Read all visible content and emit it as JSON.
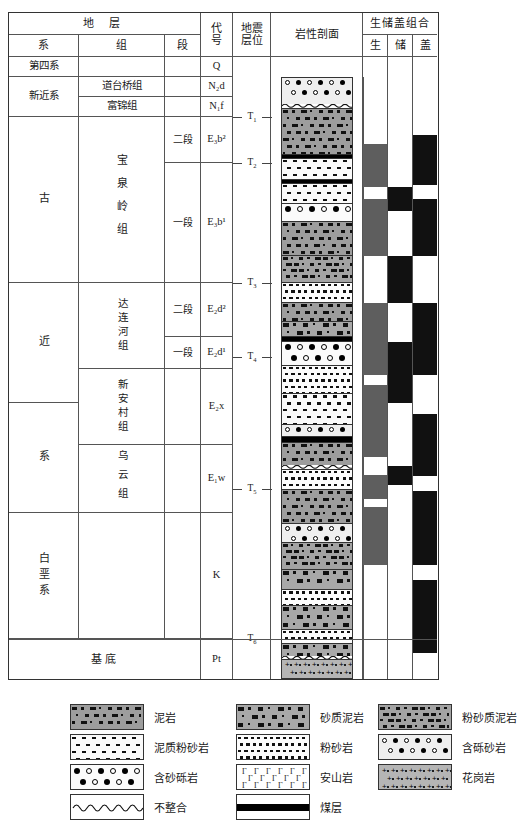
{
  "figure": {
    "type": "stratigraphic-column"
  },
  "header": {
    "strata_group": "地 层",
    "col_system": "系",
    "col_formation": "组",
    "col_member": "段",
    "col_code": "代号",
    "col_code_l1": "代",
    "col_code_l2": "号",
    "col_seismic_l1": "地震",
    "col_seismic_l2": "层位",
    "col_lithology": "岩性剖面",
    "col_assemblage": "生储盖组合",
    "col_source": "生",
    "col_reservoir": "储",
    "col_cap": "盖"
  },
  "rows": [
    {
      "system": "第四系",
      "formation": "",
      "member": "",
      "code_main": "Q",
      "code_sub": "",
      "code_sup": "",
      "code_italic": ""
    },
    {
      "system": "新近系",
      "formation": "道台桥组",
      "member": "",
      "code_main": "N",
      "code_sub": "2",
      "code_italic": "d",
      "code_sup": ""
    },
    {
      "system": "新近系",
      "formation": "富锦组",
      "member": "",
      "code_main": "N",
      "code_sub": "1",
      "code_italic": "f",
      "code_sup": ""
    },
    {
      "system": "古",
      "formation": "宝泉岭组",
      "member": "二段",
      "code_main": "E",
      "code_sub": "3",
      "code_italic": "b",
      "code_sup": "2"
    },
    {
      "system": "古",
      "formation": "宝泉岭组",
      "member": "一段",
      "code_main": "E",
      "code_sub": "3",
      "code_italic": "b",
      "code_sup": "1"
    },
    {
      "system": "近",
      "formation": "达连河组",
      "member": "二段",
      "code_main": "E",
      "code_sub": "2",
      "code_italic": "d",
      "code_sup": "2"
    },
    {
      "system": "近",
      "formation": "达连河组",
      "member": "一段",
      "code_main": "E",
      "code_sub": "2",
      "code_italic": "d",
      "code_sup": "1"
    },
    {
      "system": "近",
      "formation": "新安村组",
      "member": "",
      "code_main": "E",
      "code_sub": "2",
      "code_italic": "x",
      "code_sup": ""
    },
    {
      "system": "系",
      "formation": "乌云组",
      "member": "",
      "code_main": "E",
      "code_sub": "1",
      "code_italic": "w",
      "code_sup": ""
    },
    {
      "system": "白垩系",
      "formation": "",
      "member": "",
      "code_main": "K",
      "code_sub": "",
      "code_italic": "",
      "code_sup": ""
    },
    {
      "system": "基底",
      "formation": "",
      "member": "",
      "code_main": "Pt",
      "code_sub": "",
      "code_italic": "",
      "code_sup": ""
    }
  ],
  "system_labels": {
    "quaternary": "第四系",
    "neogene": "新近系",
    "paleogene_1": "古",
    "paleogene_2": "近",
    "paleogene_3": "系",
    "cretaceous": "白垩系",
    "basement": "基底"
  },
  "formation_labels": {
    "daotaiqiao": "道台桥组",
    "fujin": "富锦组",
    "baoquanling": "宝泉岭组",
    "dalianhe": "达连河组",
    "xinancun": "新安村组",
    "wuyun": "乌云组"
  },
  "member_labels": {
    "bql_2": "二段",
    "bql_1": "一段",
    "dlh_2": "二段",
    "dlh_1": "一段"
  },
  "codes": {
    "q": "Q",
    "n2d": "N₂d",
    "n1f": "N₁f",
    "e3b2": "E₃b²",
    "e3b1": "E₃b¹",
    "e2d2": "E₂d²",
    "e2d1": "E₂d¹",
    "e2x": "E₂x",
    "e1w": "E₁w",
    "k": "K",
    "pt": "Pt"
  },
  "seismic_horizons": [
    {
      "label": "T",
      "sub": "1"
    },
    {
      "label": "T",
      "sub": "2"
    },
    {
      "label": "T",
      "sub": "3"
    },
    {
      "label": "T",
      "sub": "4"
    },
    {
      "label": "T",
      "sub": "5"
    },
    {
      "label": "T",
      "sub": "6"
    }
  ],
  "legend": {
    "items": [
      {
        "pattern": "mudstone",
        "label": "泥岩"
      },
      {
        "pattern": "sandy-mudstone",
        "label": "砂质泥岩"
      },
      {
        "pattern": "silty-mudstone",
        "label": "粉砂质泥岩"
      },
      {
        "pattern": "muddy-siltstone",
        "label": "泥质粉砂岩"
      },
      {
        "pattern": "siltstone",
        "label": "粉砂岩"
      },
      {
        "pattern": "gravel-bearing-sandstone",
        "label": "含砾砂岩"
      },
      {
        "pattern": "sand-bearing-conglomerate",
        "label": "含砂砾岩"
      },
      {
        "pattern": "andesite",
        "label": "安山岩"
      },
      {
        "pattern": "granite",
        "label": "花岗岩"
      },
      {
        "pattern": "unconformity",
        "label": "不整合"
      },
      {
        "pattern": "coal-seam",
        "label": "煤层"
      }
    ]
  },
  "chart_data": {
    "type": "table",
    "lithology_column": [
      {
        "top": 0,
        "height": 30,
        "pattern": "gravel-bearing-sandstone",
        "unit": "N₂d / N₁f"
      },
      {
        "top": 30,
        "height": 4,
        "pattern": "unconformity",
        "unit": "T₁"
      },
      {
        "top": 34,
        "height": 52,
        "pattern": "mudstone",
        "unit": "E₃b²"
      },
      {
        "top": 86,
        "height": 4,
        "pattern": "coal-seam",
        "unit": "E₃b²"
      },
      {
        "top": 90,
        "height": 24,
        "pattern": "muddy-siltstone",
        "unit": "E₃b¹"
      },
      {
        "top": 114,
        "height": 4,
        "pattern": "coal-seam",
        "unit": "E₃b¹"
      },
      {
        "top": 118,
        "height": 22,
        "pattern": "muddy-siltstone",
        "unit": "E₃b¹"
      },
      {
        "top": 140,
        "height": 20,
        "pattern": "sand-bearing-conglomerate",
        "unit": "E₃b¹"
      },
      {
        "top": 160,
        "height": 38,
        "pattern": "mudstone",
        "unit": "E₃b¹"
      },
      {
        "top": 198,
        "height": 30,
        "pattern": "silty-mudstone",
        "unit": "E₃b¹"
      },
      {
        "top": 228,
        "height": 22,
        "pattern": "siltstone",
        "unit": "E₂d²"
      },
      {
        "top": 250,
        "height": 22,
        "pattern": "mudstone",
        "unit": "E₂d²"
      },
      {
        "top": 272,
        "height": 16,
        "pattern": "sandy-mudstone",
        "unit": "E₂d²"
      },
      {
        "top": 288,
        "height": 6,
        "pattern": "coal-seam",
        "unit": "E₂d¹"
      },
      {
        "top": 294,
        "height": 26,
        "pattern": "sand-bearing-conglomerate",
        "unit": "E₂d¹"
      },
      {
        "top": 320,
        "height": 32,
        "pattern": "siltstone",
        "unit": "E₂x"
      },
      {
        "top": 352,
        "height": 34,
        "pattern": "muddy-siltstone",
        "unit": "E₂x"
      },
      {
        "top": 386,
        "height": 14,
        "pattern": "gravel-bearing-sandstone",
        "unit": "E₂x"
      },
      {
        "top": 400,
        "height": 6,
        "pattern": "coal-seam",
        "unit": "E₁w"
      },
      {
        "top": 406,
        "height": 26,
        "pattern": "mudstone",
        "unit": "E₁w"
      },
      {
        "top": 432,
        "height": 4,
        "pattern": "unconformity",
        "unit": "T₅"
      },
      {
        "top": 436,
        "height": 22,
        "pattern": "siltstone",
        "unit": "K"
      },
      {
        "top": 458,
        "height": 38,
        "pattern": "mudstone",
        "unit": "K"
      },
      {
        "top": 496,
        "height": 22,
        "pattern": "gravel-bearing-sandstone",
        "unit": "K"
      },
      {
        "top": 518,
        "height": 30,
        "pattern": "silty-mudstone",
        "unit": "K"
      },
      {
        "top": 548,
        "height": 22,
        "pattern": "sandy-mudstone",
        "unit": "K"
      },
      {
        "top": 570,
        "height": 18,
        "pattern": "siltstone",
        "unit": "K"
      },
      {
        "top": 588,
        "height": 26,
        "pattern": "sandy-mudstone",
        "unit": "K"
      },
      {
        "top": 614,
        "height": 16,
        "pattern": "siltstone",
        "unit": "K"
      },
      {
        "top": 630,
        "height": 14,
        "pattern": "sandy-mudstone",
        "unit": "K"
      },
      {
        "top": 644,
        "height": 4,
        "pattern": "unconformity",
        "unit": "T₆"
      },
      {
        "top": 648,
        "height": 22,
        "pattern": "granite",
        "unit": "Pt"
      }
    ],
    "assemblage": {
      "columns": [
        "生",
        "储",
        "盖"
      ],
      "source_blocks": [
        {
          "top": 131,
          "height": 43
        },
        {
          "top": 186,
          "height": 57
        },
        {
          "top": 290,
          "height": 72
        },
        {
          "top": 372,
          "height": 72
        },
        {
          "top": 462,
          "height": 24
        },
        {
          "top": 494,
          "height": 58
        }
      ],
      "reservoir_blocks": [
        {
          "top": 174,
          "height": 24
        },
        {
          "top": 243,
          "height": 47
        },
        {
          "top": 329,
          "height": 61
        },
        {
          "top": 453,
          "height": 19
        }
      ],
      "cap_blocks": [
        {
          "top": 122,
          "height": 50
        },
        {
          "top": 186,
          "height": 57
        },
        {
          "top": 290,
          "height": 72
        },
        {
          "top": 401,
          "height": 62
        },
        {
          "top": 478,
          "height": 74
        },
        {
          "top": 567,
          "height": 73
        }
      ]
    }
  }
}
